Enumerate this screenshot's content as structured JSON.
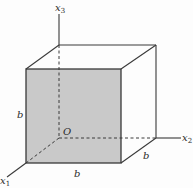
{
  "diagram": {
    "type": "cube-with-axes",
    "axes": {
      "x1": {
        "label": "x",
        "sub": "1"
      },
      "x2": {
        "label": "x",
        "sub": "2"
      },
      "x3": {
        "label": "x",
        "sub": "3"
      }
    },
    "origin_label": "O",
    "edge_labels": {
      "left": "b",
      "bottom": "b",
      "depth": "b"
    },
    "colors": {
      "front_face": "#c9c9c9",
      "line": "#3a3a3a",
      "background": "#fdfdfd"
    }
  }
}
